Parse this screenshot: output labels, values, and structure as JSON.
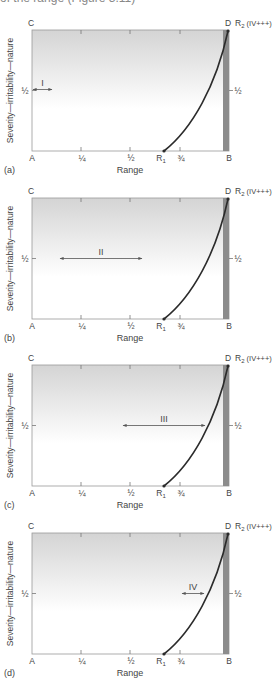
{
  "header": {
    "cut_text": "of the range (Figure 3.11)"
  },
  "axis": {
    "y_label": "Severity—irritability—nature",
    "x_label": "Range",
    "corner_top_left": "C",
    "corner_top_right": "D",
    "corner_bottom_left": "A",
    "corner_bottom_right": "B",
    "half_left": "½",
    "half_right": "½",
    "ticks": [
      "¼",
      "½",
      "¾"
    ],
    "r1_main": "R",
    "r1_sub": "1",
    "r2_main": "R",
    "r2_sub": "2",
    "r2_suffix": " (IV+++)"
  },
  "panels": [
    {
      "letter": "(a)",
      "grade": "I",
      "arrow_x1": 33,
      "arrow_x2": 52
    },
    {
      "letter": "(b)",
      "grade": "II",
      "arrow_x1": 60,
      "arrow_x2": 142
    },
    {
      "letter": "(c)",
      "grade": "III",
      "arrow_x1": 123,
      "arrow_x2": 205
    },
    {
      "letter": "(d)",
      "grade": "IV",
      "arrow_x1": 182,
      "arrow_x2": 204
    }
  ],
  "colors": {
    "shade_top": "#d6d6d6",
    "shade_bottom": "#ffffff",
    "band": "#8c8c8c",
    "curve": "#2b2b2b",
    "frame": "#9a9a9a"
  },
  "chart_data": {
    "type": "diagram",
    "xlabel": "Range",
    "ylabel": "Severity—irritability—nature",
    "x_ticks": [
      "A",
      "¼",
      "½",
      "R1",
      "¾",
      "B"
    ],
    "y_ticks": [
      "½"
    ],
    "points": {
      "R1": [
        0.68,
        0
      ],
      "R2_D": [
        1.0,
        1.0
      ]
    },
    "curve": "R1 to D (R2 IV+++), concave-up",
    "grade_arrows": [
      {
        "panel": "a",
        "grade": "I",
        "from": 0.0,
        "to": 0.1,
        "y": 0.5
      },
      {
        "panel": "b",
        "grade": "II",
        "from": 0.14,
        "to": 0.56,
        "y": 0.5
      },
      {
        "panel": "c",
        "grade": "III",
        "from": 0.46,
        "to": 0.88,
        "y": 0.5
      },
      {
        "panel": "d",
        "grade": "IV",
        "from": 0.76,
        "to": 0.88,
        "y": 0.5
      }
    ]
  }
}
